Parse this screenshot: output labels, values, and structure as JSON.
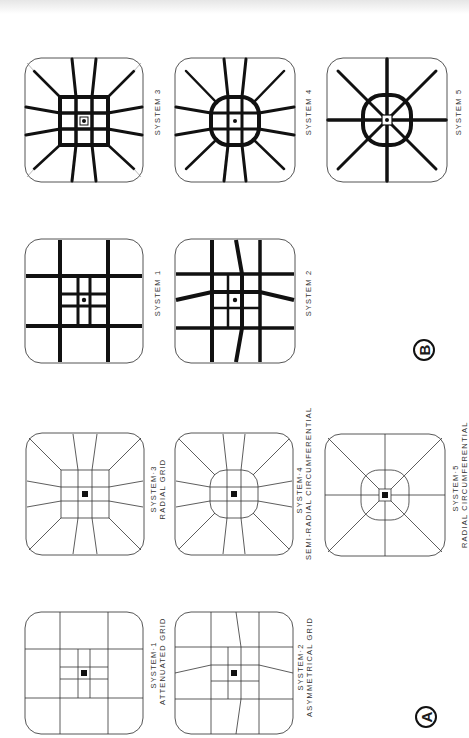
{
  "figure": {
    "sections": [
      {
        "id": "B",
        "marker": "B",
        "style": "heavy road network with tapering arterials",
        "panels": [
          {
            "id": "b-system-3",
            "label": "SYSTEM 3"
          },
          {
            "id": "b-system-1",
            "label": "SYSTEM 1"
          },
          {
            "id": "b-system-4",
            "label": "SYSTEM 4"
          },
          {
            "id": "b-system-2",
            "label": "SYSTEM 2"
          },
          {
            "id": "b-system-5",
            "label": "SYSTEM 5"
          }
        ]
      },
      {
        "id": "A",
        "marker": "A",
        "style": "thin-line schematic",
        "panels": [
          {
            "id": "a-system-3",
            "label": "SYSTEM·3",
            "sublabel": "RADIAL  GRID"
          },
          {
            "id": "a-system-1",
            "label": "SYSTEM·1",
            "sublabel": "ATTENUATED  GRID"
          },
          {
            "id": "a-system-4",
            "label": "SYSTEM·4",
            "sublabel": "SEMI-RADIAL  CIRCUMFERENTIAL"
          },
          {
            "id": "a-system-2",
            "label": "SYSTEM·2",
            "sublabel": "ASYMMETRICAL  GRID"
          },
          {
            "id": "a-system-5",
            "label": "SYSTEM·5",
            "sublabel": "RADIAL  CIRCUMFERENTIAL"
          }
        ]
      }
    ],
    "orientation": "rotated 90° counter-clockwise",
    "colors": {
      "ink": "#111111",
      "paper": "#ffffff",
      "frame": "#555555"
    }
  }
}
